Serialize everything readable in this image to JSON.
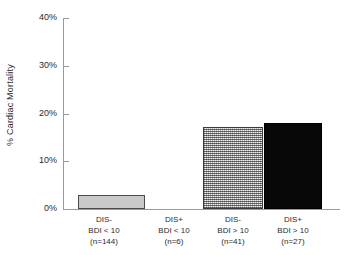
{
  "chart_data": {
    "type": "bar",
    "title": "",
    "xlabel": "",
    "ylabel": "% Cardiac Mortality",
    "ylim": [
      0,
      40
    ],
    "ytick_labels": [
      "0%",
      "10%",
      "20%",
      "30%",
      "40%"
    ],
    "ytick_values": [
      0,
      10,
      20,
      30,
      40
    ],
    "grid": false,
    "legend": null,
    "categories": [
      "DIS- BDI < 10 (n=144)",
      "DIS+ BDI < 10 (n=6)",
      "DIS- BDI > 10 (n=41)",
      "DIS+ BDI > 10 (n=27)"
    ],
    "values": [
      2.9,
      0,
      17.2,
      18.0
    ],
    "bars": [
      {
        "line1": "DIS-",
        "line2": "BDI < 10",
        "line3": "(n=144)",
        "value": 2.9,
        "fill": "light-gray",
        "color": "#c9c9c9",
        "n": 144
      },
      {
        "line1": "DIS+",
        "line2": "BDI < 10",
        "line3": "(n=6)",
        "value": 0,
        "fill": "none",
        "color": "#ffffff",
        "n": 6
      },
      {
        "line1": "DIS-",
        "line2": "BDI > 10",
        "line3": "(n=41)",
        "value": 17.2,
        "fill": "crosshatch",
        "color": "#b4b4b4",
        "n": 41
      },
      {
        "line1": "DIS+",
        "line2": "BDI > 10",
        "line3": "(n=27)",
        "value": 18.0,
        "fill": "black",
        "color": "#080808",
        "n": 27
      }
    ]
  },
  "axis": {
    "y_label": "% Cardiac Mortality",
    "tick_40": "40%",
    "tick_30": "30%",
    "tick_20": "20%",
    "tick_10": "10%",
    "tick_0": "0%"
  },
  "colors": {
    "axis": "#9a9a9a",
    "text": "#2b2b2b",
    "bar_light": "#c9c9c9",
    "bar_hatch": "#b4b4b4",
    "bar_black": "#080808"
  }
}
